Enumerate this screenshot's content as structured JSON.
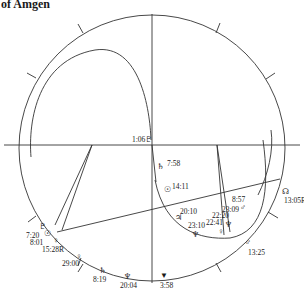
{
  "title": "of Amgen",
  "chart": {
    "type": "astrological-wheel",
    "line_color": "#333333",
    "center": [
      152,
      148
    ],
    "outer_radius": 133
  },
  "planets": [
    {
      "id": "pluto-top",
      "glyph": "♇",
      "label": "1:06",
      "suffix": "♇"
    },
    {
      "id": "saturn-1",
      "glyph": "♄",
      "label": "7:58"
    },
    {
      "id": "sun-1",
      "glyph": "☉",
      "label": "14:11"
    },
    {
      "id": "node-right",
      "glyph": "☊",
      "label": "13:05R"
    },
    {
      "id": "mars-1",
      "glyph": "♂",
      "label": "8:57"
    },
    {
      "id": "jupiter",
      "glyph": "♃",
      "label": "20:10"
    },
    {
      "id": "neptune-1",
      "glyph": "♆",
      "label": "23:10"
    },
    {
      "id": "venus",
      "glyph": "♀",
      "label": "22:41"
    },
    {
      "id": "pluto-2",
      "glyph": "♇",
      "label": "22:20"
    },
    {
      "id": "neptune-2",
      "glyph": "♆",
      "label": "23:09"
    },
    {
      "id": "mars-2",
      "glyph": "♂",
      "label": "13:25"
    },
    {
      "id": "vesta",
      "glyph": "▼",
      "label": "3:58"
    },
    {
      "id": "neptune-3",
      "glyph": "♆",
      "label": "20:04"
    },
    {
      "id": "saturn-2",
      "glyph": "♄",
      "label": "8:19"
    },
    {
      "id": "venus-2",
      "glyph": "♀",
      "label": "29:00"
    },
    {
      "id": "pluto-3",
      "glyph": "♇",
      "label": "7:20"
    },
    {
      "id": "sun-2",
      "glyph": "☉",
      "label": "8:01"
    },
    {
      "id": "venus-3",
      "glyph": "♀",
      "label": "15:28R"
    }
  ]
}
